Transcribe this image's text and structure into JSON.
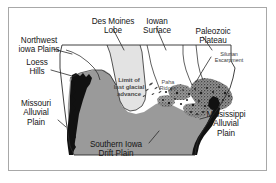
{
  "figure": {
    "border_color": "#a8a8a8",
    "background_color": "#ffffff"
  },
  "legend_colors": {
    "northwest_iowa_plains": "#ffffff",
    "des_moines_lobe": "#e3e3e3",
    "iowan_surface": "#ffffff",
    "paleozoic_plateau": "#8f8f8f",
    "southern_iowa_drift_plain": "#9a9a9a",
    "loess_hills": "#111111",
    "missouri_alluvial_plain": "#ffffff",
    "mississippi_alluvial_plain": "#111111",
    "outline": "#2b2b2b",
    "leader_line": "#2b2b2b"
  },
  "labels": {
    "northwest_iowa_plains": "Northwest\niowa Plains",
    "des_moines_lobe": "Des Moines\nLobe",
    "iowan_surface": "Iowan\nSurface",
    "paleozoic_plateau": "Paleozoic\nPlateau",
    "silurian_escarpment": "Silurian\nEscarpment",
    "loess_hills": "Loess\nHills",
    "missouri_alluvial_plain": "Missouri\nAlluvial\nPlain",
    "mississippi_alluvial_plain": "Mississippi\nAlluvial\nPlain",
    "southern_iowa_drift_plain": "Southern Iowa\nDrift Plain",
    "limit_of_last_glacial_advance": "Limit of\nlast glacial\nadvance",
    "paha_ridges": "Paha\nRidges"
  }
}
